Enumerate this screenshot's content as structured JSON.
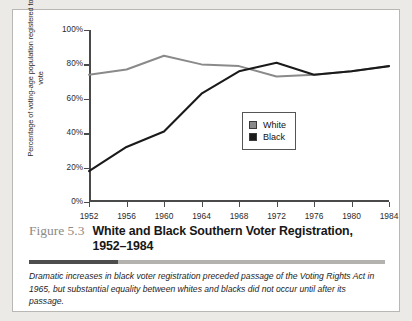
{
  "figure": {
    "number": "Figure 5.3",
    "title": "White and Black Southern Voter Registration, 1952–1984",
    "caption": "Dramatic increases in black voter registration preceded passage of the Voting Rights Act in 1965, but substantial equality between whites and blacks did not occur until after its passage."
  },
  "legend": {
    "items": [
      {
        "label": "White",
        "color": "#8a8a8a"
      },
      {
        "label": "Black",
        "color": "#1a1a1a"
      }
    ]
  },
  "chart_data": {
    "type": "line",
    "title": "White and Black Southern Voter Registration, 1952–1984",
    "xlabel": "",
    "ylabel": "Percentage of voting-age population registered to vote",
    "x": [
      1952,
      1956,
      1960,
      1964,
      1968,
      1972,
      1976,
      1980,
      1984
    ],
    "xticklabels": [
      "1952",
      "1956",
      "1960",
      "1964",
      "1968",
      "1972",
      "1976",
      "1980",
      "1984"
    ],
    "yticklabels": [
      "0%",
      "20%",
      "40%",
      "60%",
      "80%",
      "100%"
    ],
    "yticks": [
      0,
      20,
      40,
      60,
      80,
      100
    ],
    "xlim": [
      1952,
      1984
    ],
    "ylim": [
      0,
      100
    ],
    "grid": false,
    "legend_position": "center-right",
    "series": [
      {
        "name": "White",
        "color": "#8a8a8a",
        "values": [
          74,
          77,
          85,
          80,
          79,
          73,
          74,
          76,
          79
        ]
      },
      {
        "name": "Black",
        "color": "#1a1a1a",
        "values": [
          18,
          32,
          41,
          63,
          76,
          81,
          74,
          76,
          79
        ]
      }
    ]
  }
}
